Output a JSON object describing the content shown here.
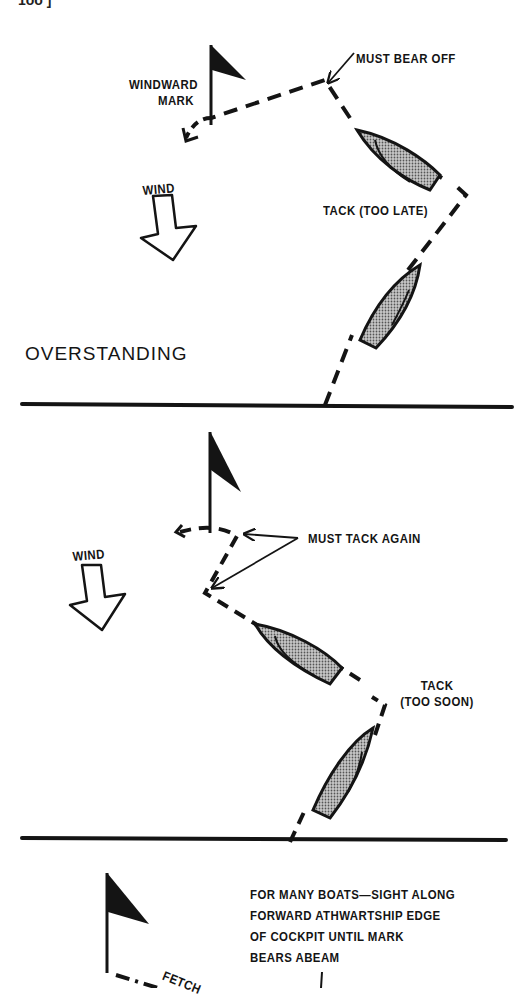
{
  "page": {
    "page_number_fragment": "1ōō ]"
  },
  "diagrams": [
    {
      "id": "overstanding",
      "title": "OVERSTANDING",
      "labels": {
        "mark": [
          "WINDWARD",
          "MARK"
        ],
        "wind": "WIND",
        "callout_top": "MUST BEAR OFF",
        "tack": "TACK (TOO LATE)"
      }
    },
    {
      "id": "understanding",
      "labels": {
        "wind": "WIND",
        "callout": "MUST TACK AGAIN",
        "tack": [
          "TACK",
          "(TOO SOON)"
        ]
      }
    },
    {
      "id": "fetching",
      "labels": {
        "note": [
          "FOR MANY BOATS—SIGHT ALONG",
          "FORWARD ATHWARTSHIP EDGE",
          "OF COCKPIT UNTIL MARK",
          "BEARS ABEAM"
        ],
        "fetch": "FETCH"
      }
    }
  ],
  "colors": {
    "ink": "#141414",
    "boat_fill": "#9a9a9a",
    "paper": "#ffffff"
  }
}
